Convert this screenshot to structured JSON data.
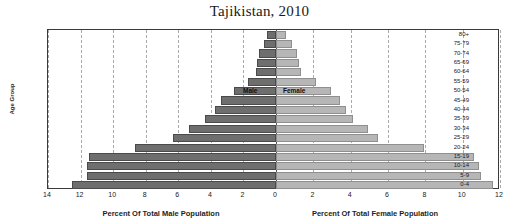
{
  "chart_data": {
    "type": "bar",
    "subtype": "population-pyramid",
    "title": "Tajikistan, 2010",
    "ylabel": "Age Group",
    "xlabel_left": "Percent Of Total Male Population",
    "xlabel_right": "Percent Of Total Female Population",
    "categories": [
      "80+",
      "75-79",
      "70-74",
      "65-69",
      "60-64",
      "55-59",
      "50-54",
      "45-49",
      "40-44",
      "35-39",
      "30-34",
      "25-29",
      "20-24",
      "15-19",
      "10-14",
      "5-9",
      "0-4"
    ],
    "left_ticks": [
      14,
      12,
      10,
      8,
      6,
      4,
      2
    ],
    "right_ticks": [
      0,
      2,
      4,
      6,
      8,
      10,
      12
    ],
    "xlim_left": [
      14,
      0
    ],
    "xlim_right": [
      0,
      12
    ],
    "grid": true,
    "grid_style": "dashed-vertical",
    "legend_position": "inside-plot-at-50-54-row",
    "series": [
      {
        "name": "Male",
        "color": "#6e6e6e",
        "side": "left",
        "values": [
          0.55,
          0.75,
          1.05,
          1.15,
          1.25,
          1.75,
          2.55,
          3.35,
          3.75,
          4.35,
          5.35,
          6.35,
          8.65,
          11.5,
          11.6,
          11.6,
          12.5
        ]
      },
      {
        "name": "Female",
        "color": "#b6b6b6",
        "side": "right",
        "values": [
          0.55,
          0.85,
          1.15,
          1.25,
          1.35,
          2.15,
          2.95,
          3.45,
          3.75,
          4.15,
          4.95,
          5.45,
          7.95,
          10.6,
          10.9,
          11.0,
          11.6
        ]
      }
    ]
  },
  "axis": {
    "left_label": "Percent Of Total Male Population",
    "right_label": "Percent Of Total Female Population",
    "y_axis_title": "Age Group"
  },
  "legend": {
    "male_label": "Male",
    "female_label": "Female"
  },
  "header": {
    "title": "Tajikistan, 2010"
  },
  "colors": {
    "male": "#6e6e6e",
    "female": "#b6b6b6",
    "grid": "#aaaaaa",
    "frame": "#3a3a3a",
    "text": "#202020"
  }
}
